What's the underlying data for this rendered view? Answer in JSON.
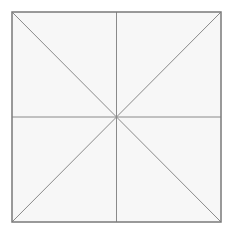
{
  "diagram": {
    "canvas": {
      "width": 231,
      "height": 235,
      "background": "#ffffff"
    },
    "square": {
      "x1": 12,
      "y1": 12,
      "x2": 221,
      "y2": 222,
      "fill": "#f7f7f7",
      "stroke": "#7a7a7a",
      "stroke_width": 1.5
    },
    "center": {
      "x": 116.5,
      "y": 117
    },
    "lines": [
      {
        "name": "vertical-line",
        "x1": 116.5,
        "y1": 12,
        "x2": 116.5,
        "y2": 222
      },
      {
        "name": "horizontal-line",
        "x1": 12,
        "y1": 117,
        "x2": 221,
        "y2": 117
      },
      {
        "name": "diagonal-line-tl-br",
        "x1": 12,
        "y1": 12,
        "x2": 221,
        "y2": 222
      },
      {
        "name": "diagonal-line-tr-bl",
        "x1": 221,
        "y1": 12,
        "x2": 12,
        "y2": 222
      }
    ],
    "line_color": "#8a8a8a",
    "line_width": 1
  }
}
